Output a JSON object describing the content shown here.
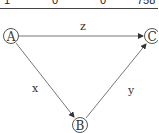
{
  "table_fragment": {
    "cells": [
      "1",
      "0",
      "0",
      "758"
    ]
  },
  "diagram": {
    "nodes": [
      {
        "id": "A",
        "label": "A"
      },
      {
        "id": "B",
        "label": "B"
      },
      {
        "id": "C",
        "label": "C"
      }
    ],
    "edges": [
      {
        "from": "A",
        "to": "C",
        "label": "z"
      },
      {
        "from": "A",
        "to": "B",
        "label": "x"
      },
      {
        "from": "B",
        "to": "C",
        "label": "y"
      }
    ],
    "colors": {
      "stroke": "#555555",
      "text": "#333333"
    }
  }
}
